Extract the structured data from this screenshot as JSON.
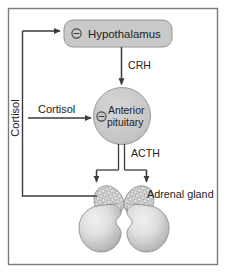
{
  "figure": {
    "type": "flow-diagram",
    "title_text": "",
    "border_color": "#7a7a7a",
    "background": "#ffffff",
    "node_fill": "#c9c9c9",
    "node_stroke": "#8f8f8f",
    "arrow_color": "#3a3a3a",
    "text_color": "#222222",
    "gland_fill_light": "#e2e2e2",
    "gland_fill_mid": "#bdbdbd",
    "gland_cap_fill": "#b5b5b5"
  },
  "nodes": {
    "hypothalamus": {
      "label": "Hypothalamus",
      "inhibition_symbol": "⊖",
      "shape": "rounded-rectangle"
    },
    "anterior_pituitary": {
      "label_line1": "Anterior",
      "label_line2": "pituitary",
      "inhibition_symbol": "⊖",
      "shape": "circle"
    },
    "adrenal_gland": {
      "label": "Adrenal gland",
      "shape": "paired-gland"
    }
  },
  "edges": {
    "crh": {
      "label": "CRH",
      "from": "hypothalamus",
      "to": "anterior_pituitary",
      "style": "single-arrow"
    },
    "acth": {
      "label": "ACTH",
      "from": "anterior_pituitary",
      "to": "adrenal_gland",
      "style": "double-line-split-arrow"
    },
    "cortisol_to_pituitary": {
      "label": "Cortisol",
      "from": "adrenal_gland",
      "to": "anterior_pituitary",
      "style": "feedback-arrow"
    },
    "cortisol_to_hypothalamus": {
      "label": "Cortisol",
      "from": "adrenal_gland",
      "to": "hypothalamus",
      "style": "feedback-arrow-vertical-label"
    }
  }
}
